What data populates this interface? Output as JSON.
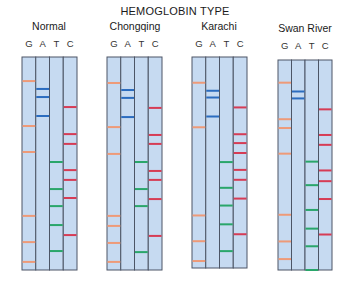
{
  "title": "HEMOGLOBIN TYPE",
  "lane_labels": [
    "G",
    "A",
    "T",
    "C"
  ],
  "colors": {
    "gel_fill": "#c6daf1",
    "gel_border": "#4c5566",
    "G": "#ee9a78",
    "A": "#2b6cbf",
    "T": "#2aa66a",
    "C": "#d63c55"
  },
  "band_units": "vertical position from top of gel (0 = top, 1 = bottom)",
  "gels": [
    {
      "name": "Normal",
      "bands": {
        "G": [
          0.113,
          0.324,
          0.446,
          0.746,
          0.869,
          0.962
        ],
        "A": [
          0.15,
          0.188,
          0.277
        ],
        "T": [
          0.493,
          0.62,
          0.7,
          0.789,
          0.911
        ],
        "C": [
          0.235,
          0.362,
          0.408,
          0.531,
          0.577,
          0.662,
          0.836
        ]
      }
    },
    {
      "name": "Chongqing",
      "bands": {
        "G": [
          0.122,
          0.329,
          0.455,
          0.746,
          0.793,
          0.873,
          0.962
        ],
        "A": [
          0.155,
          0.192,
          0.282
        ],
        "T": [
          0.493,
          0.62,
          0.7,
          0.916
        ],
        "C": [
          0.239,
          0.366,
          0.408,
          0.535,
          0.577,
          0.667,
          0.84
        ]
      }
    },
    {
      "name": "Karachi",
      "bands": {
        "G": [
          0.122,
          0.333,
          0.751,
          0.873,
          0.967
        ],
        "A": [
          0.16,
          0.192,
          0.282
        ],
        "T": [
          0.498,
          0.62,
          0.704,
          0.793,
          0.92
        ],
        "C": [
          0.239,
          0.366,
          0.408,
          0.455,
          0.535,
          0.582,
          0.671,
          0.84
        ]
      }
    },
    {
      "name": "Swan River",
      "bands": {
        "G": [
          0.108,
          0.282,
          0.324,
          0.446,
          0.737,
          0.864,
          0.948
        ],
        "A": [
          0.15,
          0.183
        ],
        "T": [
          0.484,
          0.596,
          0.714,
          0.803,
          0.887,
          1.0
        ],
        "C": [
          0.235,
          0.357,
          0.404,
          0.526,
          0.577,
          0.662,
          0.831
        ]
      }
    }
  ]
}
